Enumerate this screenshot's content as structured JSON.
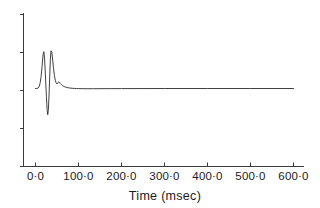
{
  "chart_data": {
    "type": "line",
    "title": "",
    "subtitle": "",
    "xlabel": "Time (msec)",
    "ylabel": "",
    "xlim": [
      -20,
      620
    ],
    "ylim": [
      0,
      1
    ],
    "grid": false,
    "legend": null,
    "x_tick_labels": [
      "0·0",
      "100·0",
      "200·0",
      "300·0",
      "400·0",
      "500·0",
      "600·0"
    ],
    "x_tick_values": [
      0,
      100,
      200,
      300,
      400,
      500,
      600
    ],
    "y_tick_labels": [
      "",
      "",
      "",
      "",
      ""
    ],
    "y_tick_count": 5,
    "series": [
      {
        "name": "response",
        "color": "#2b2b2b",
        "x": [
          0,
          3,
          6,
          9,
          11,
          13,
          15,
          16.5,
          18,
          19.5,
          21,
          22.5,
          24,
          25.5,
          27,
          28.5,
          30,
          31.5,
          33,
          34.5,
          36,
          38,
          40,
          42,
          44,
          46,
          48,
          50,
          52,
          54,
          56,
          58,
          60,
          63,
          66,
          70,
          75,
          80,
          85,
          90,
          95,
          100,
          110,
          120,
          135,
          150,
          175,
          200,
          250,
          300,
          350,
          400,
          450,
          500,
          550,
          600
        ],
        "y": [
          0.0,
          0.0,
          0.01,
          0.05,
          0.13,
          0.26,
          0.45,
          0.62,
          0.76,
          0.8,
          0.66,
          0.4,
          0.1,
          -0.2,
          -0.46,
          -0.57,
          -0.45,
          -0.14,
          0.25,
          0.62,
          0.82,
          0.79,
          0.62,
          0.43,
          0.28,
          0.18,
          0.12,
          0.1,
          0.12,
          0.145,
          0.13,
          0.105,
          0.085,
          0.062,
          0.045,
          0.03,
          0.018,
          0.01,
          0.005,
          0.002,
          0.0,
          -0.002,
          -0.004,
          -0.005,
          -0.005,
          -0.004,
          -0.003,
          -0.002,
          -0.001,
          0.0,
          0.0,
          0.0,
          0.0,
          0.0,
          0.0,
          0.0
        ]
      }
    ],
    "annotations": {
      "first_peak_time_msec": 19.5,
      "trough_time_msec": 28.5,
      "second_peak_time_msec": 36,
      "secondary_bump_time_msec": 54,
      "settled_after_msec": 100
    }
  },
  "figure": {
    "axis_color": "#3a3a3a",
    "trace_color": "#2b2b2b",
    "background": "#ffffff"
  }
}
